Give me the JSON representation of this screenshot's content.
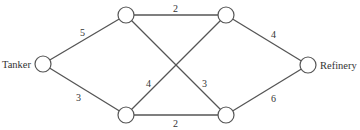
{
  "diagram": {
    "type": "weighted-network",
    "nodes": [
      {
        "id": "tanker",
        "label": "Tanker",
        "x": 43,
        "y": 64
      },
      {
        "id": "tl",
        "label": "",
        "x": 126,
        "y": 15
      },
      {
        "id": "tr",
        "label": "",
        "x": 226,
        "y": 15
      },
      {
        "id": "bl",
        "label": "",
        "x": 126,
        "y": 115
      },
      {
        "id": "br",
        "label": "",
        "x": 226,
        "y": 115
      },
      {
        "id": "refinery",
        "label": "Refinery",
        "x": 308,
        "y": 65
      }
    ],
    "edges": [
      {
        "from": "tanker",
        "to": "tl",
        "weight": "5"
      },
      {
        "from": "tanker",
        "to": "bl",
        "weight": "3"
      },
      {
        "from": "tl",
        "to": "tr",
        "weight": "2"
      },
      {
        "from": "bl",
        "to": "br",
        "weight": "2"
      },
      {
        "from": "bl",
        "to": "tr",
        "weight": "4"
      },
      {
        "from": "tl",
        "to": "br",
        "weight": "3"
      },
      {
        "from": "tr",
        "to": "refinery",
        "weight": "4"
      },
      {
        "from": "br",
        "to": "refinery",
        "weight": "6"
      }
    ]
  }
}
